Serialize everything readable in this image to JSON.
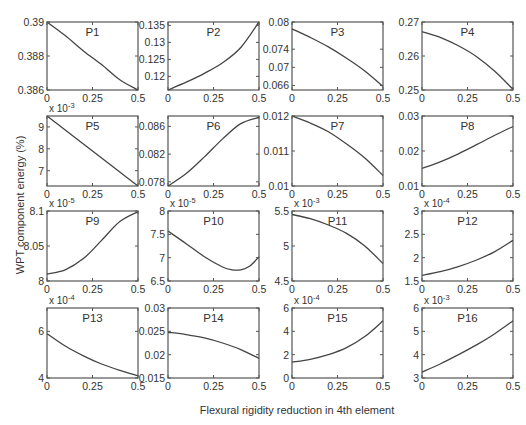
{
  "figure": {
    "xlabel": "Flexural rigidity reduction in 4th element",
    "ylabel": "WPT component energy (%)"
  },
  "chart_data": [
    {
      "type": "line",
      "title": "P1",
      "xlim": [
        0,
        0.5
      ],
      "ylim": [
        0.386,
        0.39
      ],
      "xticks": [
        "0",
        "0.25",
        "0.5"
      ],
      "yticks": [
        "0.386",
        "0.388",
        "0.39"
      ],
      "multiplier": "",
      "x": [
        0,
        0.1,
        0.2,
        0.3,
        0.4,
        0.5
      ],
      "y": [
        0.39,
        0.3892,
        0.3883,
        0.3875,
        0.3866,
        0.386
      ]
    },
    {
      "type": "line",
      "title": "P2",
      "xlim": [
        0,
        0.5
      ],
      "ylim": [
        0.116,
        0.136
      ],
      "xticks": [
        "0",
        "0.25",
        "0.5"
      ],
      "yticks": [
        "0.12",
        "0.125",
        "0.13",
        "0.135"
      ],
      "multiplier": "",
      "x": [
        0,
        0.1,
        0.2,
        0.3,
        0.4,
        0.5
      ],
      "y": [
        0.116,
        0.1183,
        0.1209,
        0.124,
        0.1285,
        0.136
      ]
    },
    {
      "type": "line",
      "title": "P3",
      "xlim": [
        0,
        0.5
      ],
      "ylim": [
        0.065,
        0.08
      ],
      "xticks": [
        "0",
        "0.25",
        "0.5"
      ],
      "yticks": [
        "0.066",
        "0.07",
        "0.074",
        "0.08"
      ],
      "multiplier": "",
      "x": [
        0,
        0.1,
        0.2,
        0.3,
        0.4,
        0.5
      ],
      "y": [
        0.0785,
        0.0766,
        0.0745,
        0.072,
        0.0692,
        0.0658
      ]
    },
    {
      "type": "line",
      "title": "P4",
      "xlim": [
        0,
        0.5
      ],
      "ylim": [
        0.25,
        0.27
      ],
      "xticks": [
        "0",
        "0.25",
        "0.5"
      ],
      "yticks": [
        "0.25",
        "0.26",
        "0.27"
      ],
      "multiplier": "",
      "x": [
        0,
        0.1,
        0.2,
        0.3,
        0.4,
        0.5
      ],
      "y": [
        0.2672,
        0.2655,
        0.263,
        0.2598,
        0.2555,
        0.2502
      ]
    },
    {
      "type": "line",
      "title": "P5",
      "xlim": [
        0,
        0.5
      ],
      "ylim": [
        6.3,
        9.5
      ],
      "xticks": [
        "0",
        "0.25",
        "0.5"
      ],
      "yticks": [
        "7",
        "8",
        "9"
      ],
      "multiplier": "x 10^-3",
      "x": [
        0,
        0.1,
        0.2,
        0.3,
        0.4,
        0.5
      ],
      "y": [
        9.5,
        8.86,
        8.22,
        7.58,
        6.94,
        6.3
      ]
    },
    {
      "type": "line",
      "title": "P6",
      "xlim": [
        0,
        0.5
      ],
      "ylim": [
        0.0774,
        0.0875
      ],
      "xticks": [
        "0",
        "0.25",
        "0.5"
      ],
      "yticks": [
        "0.078",
        "0.082",
        "0.086"
      ],
      "multiplier": "",
      "x": [
        0,
        0.1,
        0.2,
        0.3,
        0.4,
        0.5
      ],
      "y": [
        0.0774,
        0.0792,
        0.0816,
        0.0842,
        0.0864,
        0.0873
      ]
    },
    {
      "type": "line",
      "title": "P7",
      "xlim": [
        0,
        0.5
      ],
      "ylim": [
        0.01,
        0.012
      ],
      "xticks": [
        "0",
        "0.25",
        "0.5"
      ],
      "yticks": [
        "0.01",
        "0.011",
        "0.012"
      ],
      "multiplier": "",
      "x": [
        0,
        0.1,
        0.2,
        0.3,
        0.4,
        0.5
      ],
      "y": [
        0.012,
        0.0118,
        0.01155,
        0.0112,
        0.0108,
        0.0103
      ]
    },
    {
      "type": "line",
      "title": "P8",
      "xlim": [
        0,
        0.5
      ],
      "ylim": [
        0.01,
        0.03
      ],
      "xticks": [
        "0",
        "0.25",
        "0.5"
      ],
      "yticks": [
        "0.01",
        "0.02",
        "0.03"
      ],
      "multiplier": "",
      "x": [
        0,
        0.1,
        0.2,
        0.3,
        0.4,
        0.5
      ],
      "y": [
        0.015,
        0.0169,
        0.0192,
        0.0218,
        0.0245,
        0.027
      ]
    },
    {
      "type": "line",
      "title": "P9",
      "xlim": [
        0,
        0.5
      ],
      "ylim": [
        8,
        8.1
      ],
      "xticks": [
        "0",
        "0.25",
        "0.5"
      ],
      "yticks": [
        "8",
        "8.05",
        "8.1"
      ],
      "multiplier": "x 10^-5",
      "x": [
        0,
        0.1,
        0.2,
        0.3,
        0.4,
        0.5
      ],
      "y": [
        8.01,
        8.016,
        8.032,
        8.058,
        8.085,
        8.099
      ]
    },
    {
      "type": "line",
      "title": "P10",
      "xlim": [
        0,
        0.5
      ],
      "ylim": [
        6.5,
        8
      ],
      "xticks": [
        "0",
        "0.25",
        "0.5"
      ],
      "yticks": [
        "6.5",
        "7",
        "7.5",
        "8"
      ],
      "multiplier": "x 10^-5",
      "x": [
        0,
        0.1,
        0.2,
        0.3,
        0.35,
        0.4,
        0.45,
        0.5
      ],
      "y": [
        7.57,
        7.3,
        7.02,
        6.8,
        6.74,
        6.74,
        6.82,
        7.02
      ]
    },
    {
      "type": "line",
      "title": "P11",
      "xlim": [
        0,
        0.5
      ],
      "ylim": [
        4.5,
        5.5
      ],
      "xticks": [
        "0",
        "0.25",
        "0.5"
      ],
      "yticks": [
        "4.5",
        "5",
        "5.5"
      ],
      "multiplier": "x 10^-3",
      "x": [
        0,
        0.1,
        0.2,
        0.3,
        0.4,
        0.5
      ],
      "y": [
        5.45,
        5.39,
        5.3,
        5.18,
        5.0,
        4.75
      ]
    },
    {
      "type": "line",
      "title": "P12",
      "xlim": [
        0,
        0.5
      ],
      "ylim": [
        1.5,
        3
      ],
      "xticks": [
        "0",
        "0.25",
        "0.5"
      ],
      "yticks": [
        "1.5",
        "2",
        "2.5",
        "3"
      ],
      "multiplier": "x 10^-4",
      "x": [
        0,
        0.1,
        0.2,
        0.3,
        0.4,
        0.5
      ],
      "y": [
        1.62,
        1.7,
        1.81,
        1.95,
        2.13,
        2.37
      ]
    },
    {
      "type": "line",
      "title": "P13",
      "xlim": [
        0,
        0.5
      ],
      "ylim": [
        4,
        7
      ],
      "xticks": [
        "0",
        "0.25",
        "0.5"
      ],
      "yticks": [
        "4",
        "6"
      ],
      "multiplier": "x 10^-4",
      "x": [
        0,
        0.1,
        0.2,
        0.3,
        0.4,
        0.5
      ],
      "y": [
        5.9,
        5.37,
        4.95,
        4.6,
        4.33,
        4.1
      ]
    },
    {
      "type": "line",
      "title": "P14",
      "xlim": [
        0,
        0.5
      ],
      "ylim": [
        0.015,
        0.03
      ],
      "xticks": [
        "0",
        "0.25",
        "0.5"
      ],
      "yticks": [
        "0.015",
        "0.02",
        "0.025",
        "0.03"
      ],
      "multiplier": "",
      "x": [
        0,
        0.1,
        0.2,
        0.3,
        0.4,
        0.5
      ],
      "y": [
        0.0248,
        0.0243,
        0.0236,
        0.0225,
        0.0211,
        0.0192
      ]
    },
    {
      "type": "line",
      "title": "P15",
      "xlim": [
        0,
        0.5
      ],
      "ylim": [
        0,
        6
      ],
      "xticks": [
        "0",
        "0.25",
        "0.5"
      ],
      "yticks": [
        "0",
        "2",
        "4",
        "6"
      ],
      "multiplier": "x 10^-4",
      "x": [
        0,
        0.1,
        0.2,
        0.3,
        0.4,
        0.5
      ],
      "y": [
        1.35,
        1.6,
        2.0,
        2.6,
        3.55,
        4.9
      ]
    },
    {
      "type": "line",
      "title": "P16",
      "xlim": [
        0,
        0.5
      ],
      "ylim": [
        3,
        6
      ],
      "xticks": [
        "0",
        "0.25",
        "0.5"
      ],
      "yticks": [
        "3",
        "4",
        "5",
        "6"
      ],
      "multiplier": "x 10^-3",
      "x": [
        0,
        0.1,
        0.2,
        0.3,
        0.4,
        0.5
      ],
      "y": [
        3.25,
        3.6,
        4.0,
        4.42,
        4.9,
        5.45
      ]
    }
  ]
}
